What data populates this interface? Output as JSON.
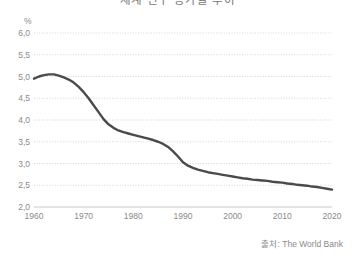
{
  "chart_data": {
    "type": "line",
    "title": "세계 인구 증가율 추이",
    "xlabel": "",
    "ylabel": "",
    "unit_label": "%",
    "xlim": [
      1960,
      2020
    ],
    "ylim": [
      2.0,
      6.0
    ],
    "grid": true,
    "grid_style": "dotted",
    "legend": "none",
    "line_color": "#4a4a4a",
    "x_ticks": [
      1960,
      1970,
      1980,
      1990,
      2000,
      2010,
      2020
    ],
    "x_tick_labels": [
      "1960",
      "1970",
      "1980",
      "1990",
      "2000",
      "2010",
      "2020"
    ],
    "y_ticks": [
      2.0,
      2.5,
      3.0,
      3.5,
      4.0,
      4.5,
      5.0,
      5.5,
      6.0
    ],
    "y_tick_labels": [
      "2,0",
      "2,5",
      "3,0",
      "3,5",
      "4,0",
      "4,5",
      "5,0",
      "5,5",
      "6,0"
    ],
    "series": [
      {
        "name": "인구 증가율",
        "x": [
          1960,
          1961,
          1962,
          1963,
          1964,
          1965,
          1966,
          1967,
          1968,
          1969,
          1970,
          1971,
          1972,
          1973,
          1974,
          1975,
          1976,
          1977,
          1978,
          1979,
          1980,
          1981,
          1982,
          1983,
          1984,
          1985,
          1986,
          1987,
          1988,
          1989,
          1990,
          1991,
          1992,
          1993,
          1994,
          1995,
          1996,
          1997,
          1998,
          1999,
          2000,
          2001,
          2002,
          2003,
          2004,
          2005,
          2006,
          2007,
          2008,
          2009,
          2010,
          2011,
          2012,
          2013,
          2014,
          2015,
          2016,
          2017,
          2018,
          2019,
          2020
        ],
        "values": [
          4.95,
          5.0,
          5.03,
          5.05,
          5.05,
          5.02,
          4.98,
          4.93,
          4.86,
          4.76,
          4.64,
          4.5,
          4.34,
          4.18,
          4.02,
          3.9,
          3.82,
          3.76,
          3.72,
          3.69,
          3.66,
          3.63,
          3.6,
          3.57,
          3.54,
          3.5,
          3.45,
          3.38,
          3.28,
          3.16,
          3.03,
          2.95,
          2.9,
          2.86,
          2.83,
          2.8,
          2.78,
          2.76,
          2.74,
          2.72,
          2.7,
          2.68,
          2.66,
          2.65,
          2.63,
          2.62,
          2.61,
          2.6,
          2.58,
          2.57,
          2.56,
          2.54,
          2.53,
          2.51,
          2.5,
          2.49,
          2.47,
          2.46,
          2.44,
          2.42,
          2.4
        ]
      }
    ]
  },
  "source": {
    "label": "출처: The World Bank"
  }
}
